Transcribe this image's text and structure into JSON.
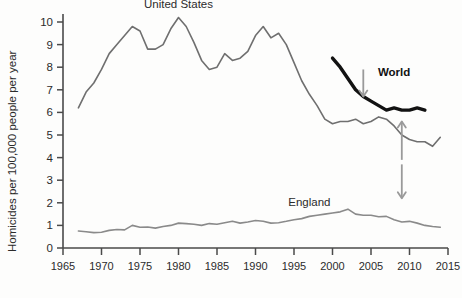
{
  "chart_data": {
    "type": "line",
    "title": "",
    "xlabel": "",
    "ylabel": "Homicides per 100,000 people per year",
    "xlim": [
      1965,
      2015
    ],
    "ylim": [
      0,
      10
    ],
    "xticks": [
      1965,
      1970,
      1975,
      1980,
      1985,
      1990,
      1995,
      2000,
      2005,
      2010,
      2015
    ],
    "yticks": [
      0,
      1,
      2,
      3,
      4,
      5,
      6,
      7,
      8,
      9,
      10
    ],
    "xtick_labels": [
      "1965",
      "1970",
      "1975",
      "1980",
      "1985",
      "1990",
      "1995",
      "2000",
      "2005",
      "2010",
      "2015"
    ],
    "ytick_labels": [
      "0",
      "1",
      "2",
      "3",
      "4",
      "5",
      "6",
      "7",
      "8",
      "9",
      "10"
    ],
    "grid": false,
    "legend_position": "inline-annotations",
    "series": [
      {
        "name": "United States",
        "color": "#6f6f6f",
        "width": 1.6,
        "label_x": 1980,
        "label_y": 10.6,
        "x": [
          1967,
          1968,
          1969,
          1970,
          1971,
          1972,
          1973,
          1974,
          1975,
          1976,
          1977,
          1978,
          1979,
          1980,
          1981,
          1982,
          1983,
          1984,
          1985,
          1986,
          1987,
          1988,
          1989,
          1990,
          1991,
          1992,
          1993,
          1994,
          1995,
          1996,
          1997,
          1998,
          1999,
          2000,
          2001,
          2002,
          2003,
          2004,
          2005,
          2006,
          2007,
          2008,
          2009,
          2010,
          2011,
          2012,
          2013,
          2014
        ],
        "values": [
          6.2,
          6.9,
          7.3,
          7.9,
          8.6,
          9.0,
          9.4,
          9.8,
          9.6,
          8.8,
          8.8,
          9.0,
          9.7,
          10.2,
          9.8,
          9.1,
          8.3,
          7.9,
          8.0,
          8.6,
          8.3,
          8.4,
          8.7,
          9.4,
          9.8,
          9.3,
          9.5,
          9.0,
          8.2,
          7.4,
          6.8,
          6.3,
          5.7,
          5.5,
          5.6,
          5.6,
          5.7,
          5.5,
          5.6,
          5.8,
          5.7,
          5.4,
          5.0,
          4.8,
          4.7,
          4.7,
          4.5,
          4.9
        ]
      },
      {
        "name": "World",
        "color": "#121212",
        "width": 3.4,
        "label_x": 2008,
        "label_y": 7.6,
        "x": [
          2000,
          2001,
          2002,
          2003,
          2004,
          2005,
          2006,
          2007,
          2008,
          2009,
          2010,
          2011,
          2012
        ],
        "values": [
          8.4,
          8.0,
          7.5,
          7.0,
          6.7,
          6.5,
          6.3,
          6.1,
          6.2,
          6.1,
          6.1,
          6.2,
          6.1
        ]
      },
      {
        "name": "England",
        "color": "#8a8a8a",
        "width": 1.6,
        "label_x": 1997,
        "label_y": 1.85,
        "x": [
          1967,
          1968,
          1969,
          1970,
          1971,
          1972,
          1973,
          1974,
          1975,
          1976,
          1977,
          1978,
          1979,
          1980,
          1981,
          1982,
          1983,
          1984,
          1985,
          1986,
          1987,
          1988,
          1989,
          1990,
          1991,
          1992,
          1993,
          1994,
          1995,
          1996,
          1997,
          1998,
          1999,
          2000,
          2001,
          2002,
          2003,
          2004,
          2005,
          2006,
          2007,
          2008,
          2009,
          2010,
          2011,
          2012,
          2013,
          2014
        ],
        "values": [
          0.75,
          0.72,
          0.68,
          0.7,
          0.78,
          0.82,
          0.8,
          1.0,
          0.92,
          0.93,
          0.88,
          0.95,
          1.0,
          1.1,
          1.08,
          1.05,
          1.0,
          1.08,
          1.05,
          1.12,
          1.18,
          1.1,
          1.15,
          1.22,
          1.18,
          1.1,
          1.12,
          1.18,
          1.25,
          1.3,
          1.4,
          1.45,
          1.5,
          1.55,
          1.6,
          1.72,
          1.5,
          1.45,
          1.45,
          1.38,
          1.4,
          1.25,
          1.15,
          1.18,
          1.1,
          1.0,
          0.95,
          0.92
        ]
      }
    ],
    "annotations": [
      {
        "name": "world-pointer-arrow",
        "direction": "down",
        "x": 2004,
        "y_from": 7.9,
        "y_to": 6.7,
        "color": "#9a9a9a"
      },
      {
        "name": "gap-arrow-up",
        "direction": "up",
        "x": 2009,
        "y_from": 3.9,
        "y_to": 5.6,
        "color": "#9a9a9a"
      },
      {
        "name": "gap-arrow-down",
        "direction": "down",
        "x": 2009,
        "y_from": 3.7,
        "y_to": 2.2,
        "color": "#9a9a9a"
      }
    ]
  }
}
